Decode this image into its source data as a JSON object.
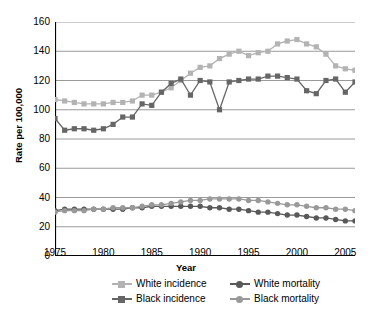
{
  "chart_data": {
    "type": "line",
    "title": "",
    "xlabel": "Year",
    "ylabel": "Rate per 100,000",
    "xlim": [
      1975,
      2006
    ],
    "ylim": [
      0,
      160
    ],
    "ytick_step": 20,
    "xtick_step": 1,
    "grid": "horizontal",
    "legend_position": "bottom",
    "xticks": [
      1975,
      1980,
      1985,
      1990,
      1995,
      2000,
      2005
    ],
    "yticks": [
      0,
      20,
      40,
      60,
      80,
      100,
      120,
      140,
      160
    ],
    "x": [
      1975,
      1976,
      1977,
      1978,
      1979,
      1980,
      1981,
      1982,
      1983,
      1984,
      1985,
      1986,
      1987,
      1988,
      1989,
      1990,
      1991,
      1992,
      1993,
      1994,
      1995,
      1996,
      1997,
      1998,
      1999,
      2000,
      2001,
      2002,
      2003,
      2004,
      2005,
      2006
    ],
    "series": [
      {
        "name": "White incidence",
        "key": "white_incidence",
        "color": "#b3b3b3",
        "marker": "square",
        "values": [
          107,
          106,
          105,
          104,
          104,
          104,
          105,
          105,
          106,
          110,
          110,
          112,
          115,
          120,
          125,
          129,
          130,
          135,
          138,
          140,
          137,
          139,
          140,
          145,
          147,
          148,
          145,
          143,
          138,
          130,
          128,
          127
        ]
      },
      {
        "name": "Black incidence",
        "key": "black_incidence",
        "color": "#666666",
        "marker": "square",
        "values": [
          94,
          86,
          87,
          87,
          86,
          87,
          90,
          95,
          95,
          104,
          103,
          112,
          118,
          121,
          110,
          120,
          119,
          100,
          119,
          120,
          121,
          121,
          123,
          123,
          122,
          121,
          113,
          111,
          120,
          121,
          112,
          119
        ]
      },
      {
        "name": "White mortality",
        "key": "white_mortality",
        "color": "#595959",
        "marker": "circle",
        "values": [
          31,
          32,
          32,
          32,
          32,
          32,
          32,
          32,
          33,
          33,
          34,
          34,
          34,
          34,
          34,
          34,
          33,
          33,
          32,
          32,
          31,
          30,
          30,
          29,
          28,
          28,
          27,
          26,
          26,
          25,
          24,
          24
        ]
      },
      {
        "name": "Black mortality",
        "key": "black_mortality",
        "color": "#999999",
        "marker": "circle",
        "values": [
          30,
          31,
          31,
          31,
          32,
          32,
          33,
          33,
          33,
          34,
          35,
          35,
          36,
          37,
          38,
          38,
          39,
          39,
          39,
          39,
          38,
          38,
          37,
          36,
          35,
          35,
          34,
          33,
          33,
          32,
          32,
          31
        ]
      }
    ]
  },
  "legend": {
    "items": [
      {
        "label": "White incidence",
        "key": "white_incidence"
      },
      {
        "label": "Black incidence",
        "key": "black_incidence"
      },
      {
        "label": "White mortality",
        "key": "white_mortality"
      },
      {
        "label": "Black mortality",
        "key": "black_mortality"
      }
    ]
  }
}
